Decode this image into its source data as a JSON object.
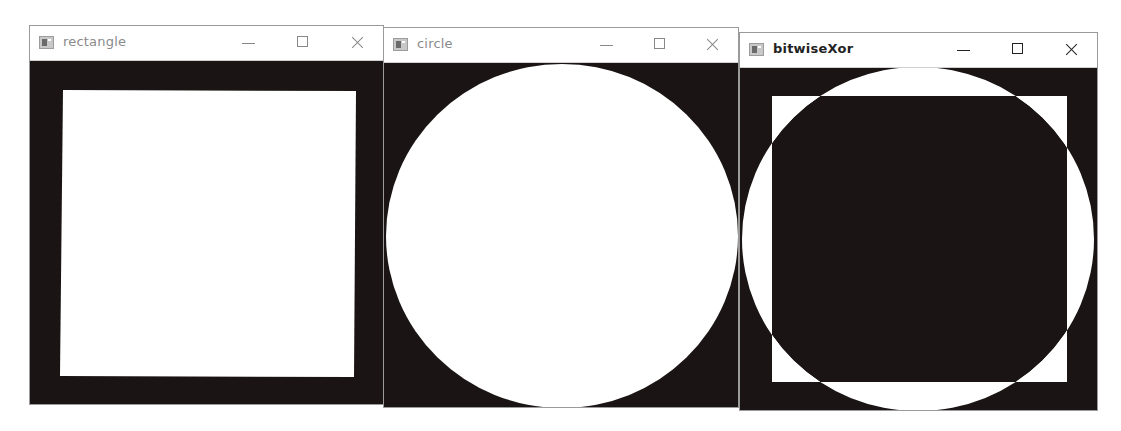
{
  "windows": [
    {
      "title": "rectangle",
      "controls": {
        "minimize": "minimize",
        "maximize": "maximize",
        "close": "close"
      },
      "image": {
        "background": "#1a1414",
        "shape": "rectangle",
        "fill": "#ffffff"
      }
    },
    {
      "title": "circle",
      "controls": {
        "minimize": "minimize",
        "maximize": "maximize",
        "close": "close"
      },
      "image": {
        "background": "#1a1414",
        "shape": "circle",
        "fill": "#ffffff"
      }
    },
    {
      "title": "bitwiseXor",
      "controls": {
        "minimize": "minimize",
        "maximize": "maximize",
        "close": "close"
      },
      "image": {
        "background": "#1a1414",
        "shape": "xor of rectangle and circle",
        "fill": "#ffffff"
      }
    }
  ]
}
